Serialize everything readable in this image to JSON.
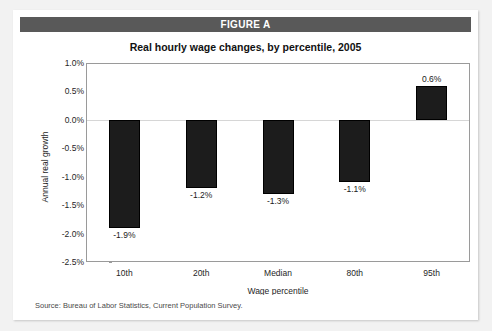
{
  "figure": {
    "header_label": "FIGURE A",
    "header_color": "#595959",
    "title": "Real hourly wage changes, by percentile, 2005",
    "source": "Source:  Bureau of Labor Statistics, Current Population Survey."
  },
  "chart_data": {
    "type": "bar",
    "title": "Real hourly wage changes, by percentile, 2005",
    "xlabel": "Wage percentile",
    "ylabel": "Annual real growth",
    "categories": [
      "10th",
      "20th",
      "Median",
      "80th",
      "95th"
    ],
    "values": [
      -1.9,
      -1.2,
      -1.3,
      -1.1,
      0.6
    ],
    "value_labels": [
      "-1.9%",
      "-1.2%",
      "-1.3%",
      "-1.1%",
      "0.6%"
    ],
    "ylim": [
      -2.5,
      1.0
    ],
    "ytick_values": [
      1.0,
      0.5,
      0.0,
      -0.5,
      -1.0,
      -1.5,
      -2.0,
      -2.5
    ],
    "ytick_labels": [
      "1.0%",
      "0.5%",
      "0.0%",
      "-0.5%",
      "-1.0%",
      "-1.5%",
      "-2.0%",
      "-2.5%"
    ],
    "grid": false,
    "zero_line": true,
    "legend": null,
    "bar_color": "#1c1c1c"
  }
}
